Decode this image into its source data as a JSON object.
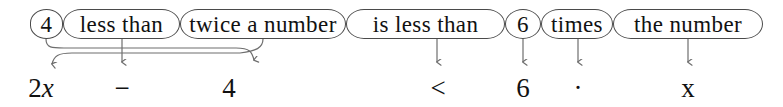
{
  "diagram": {
    "title": "4 less than twice a number is less than 6 times the number",
    "type": "phrase-to-expression translation",
    "colors": {
      "bubble_stroke": "#4a4a4a",
      "connector_stroke": "#6e6e6e",
      "text": "#111111",
      "background": "#ffffff"
    },
    "phrases": [
      {
        "label": "4",
        "x": 30,
        "width": 33,
        "arrow_to": "four"
      },
      {
        "label": "less than",
        "x": 63,
        "width": 117,
        "arrow_to": "minus"
      },
      {
        "label": "twice a number",
        "x": 180,
        "width": 166,
        "arrow_to": "two-x"
      },
      {
        "label": "is less than",
        "x": 346,
        "width": 159,
        "arrow_to": "less-than-sign"
      },
      {
        "label": "6",
        "x": 505,
        "width": 36,
        "arrow_to": "six"
      },
      {
        "label": "times",
        "x": 541,
        "width": 72,
        "arrow_to": "dot"
      },
      {
        "label": "the number",
        "x": 613,
        "width": 150,
        "arrow_to": "x"
      }
    ],
    "expression": {
      "full": "2x - 4 < 6 · x",
      "tokens": [
        {
          "id": "two-x",
          "text": "2x",
          "math": "2x",
          "x": 18,
          "width": 46,
          "italic_tail": "x"
        },
        {
          "id": "minus",
          "text": "−",
          "math": "-",
          "x": 100,
          "width": 44
        },
        {
          "id": "four",
          "text": "4",
          "math": "4",
          "x": 213,
          "width": 32
        },
        {
          "id": "less-than-sign",
          "text": "<",
          "math": "<",
          "x": 422,
          "width": 32
        },
        {
          "id": "six",
          "text": "6",
          "math": "6",
          "x": 507,
          "width": 32
        },
        {
          "id": "dot",
          "text": "·",
          "math": "*",
          "x": 562,
          "width": 32
        },
        {
          "id": "x",
          "text": "x",
          "math": "x",
          "x": 672,
          "width": 32
        }
      ]
    }
  }
}
